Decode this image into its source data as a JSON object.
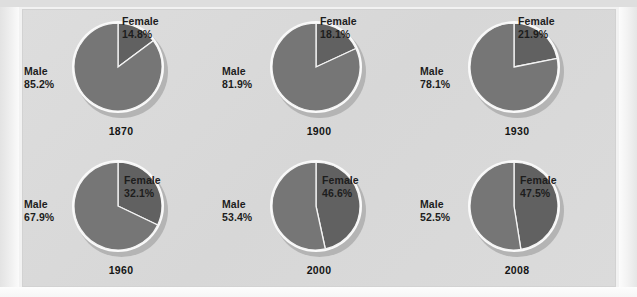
{
  "figure": {
    "background_color": "#dcdcdc",
    "male_color": "#767676",
    "female_color": "#616161",
    "label_color": "#1d1d1d"
  },
  "chart_data": {
    "type": "pie",
    "title": "",
    "subtitle": "",
    "xlabel": "",
    "ylabel": "",
    "legend_position": "none",
    "grid": false,
    "categories": [
      "Male",
      "Female"
    ],
    "units": "percent",
    "panels": [
      {
        "year": "1870",
        "slices": [
          {
            "name": "Male",
            "label": "Male",
            "value_label": "85.2%",
            "value": 85.2,
            "color": "#767676"
          },
          {
            "name": "Female",
            "label": "Female",
            "value_label": "14.8%",
            "value": 14.8,
            "color": "#616161"
          }
        ]
      },
      {
        "year": "1900",
        "slices": [
          {
            "name": "Male",
            "label": "Male",
            "value_label": "81.9%",
            "value": 81.9,
            "color": "#767676"
          },
          {
            "name": "Female",
            "label": "Female",
            "value_label": "18.1%",
            "value": 18.1,
            "color": "#616161"
          }
        ]
      },
      {
        "year": "1930",
        "slices": [
          {
            "name": "Male",
            "label": "Male",
            "value_label": "78.1%",
            "value": 78.1,
            "color": "#767676"
          },
          {
            "name": "Female",
            "label": "Female",
            "value_label": "21.9%",
            "value": 21.9,
            "color": "#616161"
          }
        ]
      },
      {
        "year": "1960",
        "slices": [
          {
            "name": "Male",
            "label": "Male",
            "value_label": "67.9%",
            "value": 67.9,
            "color": "#767676"
          },
          {
            "name": "Female",
            "label": "Female",
            "value_label": "32.1%",
            "value": 32.1,
            "color": "#616161"
          }
        ]
      },
      {
        "year": "2000",
        "slices": [
          {
            "name": "Male",
            "label": "Male",
            "value_label": "53.4%",
            "value": 53.4,
            "color": "#767676"
          },
          {
            "name": "Female",
            "label": "Female",
            "value_label": "46.6%",
            "value": 46.6,
            "color": "#616161"
          }
        ]
      },
      {
        "year": "2008",
        "slices": [
          {
            "name": "Male",
            "label": "Male",
            "value_label": "52.5%",
            "value": 52.5,
            "color": "#767676"
          },
          {
            "name": "Female",
            "label": "Female",
            "value_label": "47.5%",
            "value": 47.5,
            "color": "#616161"
          }
        ]
      }
    ]
  }
}
